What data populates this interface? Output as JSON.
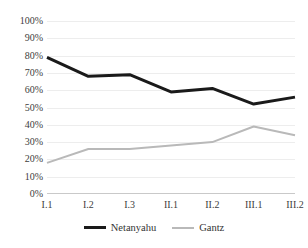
{
  "chart_data": {
    "type": "line",
    "title": "",
    "subtitle": "",
    "xlabel": "",
    "ylabel": "",
    "categories": [
      "I.1",
      "I.2",
      "I.3",
      "II.1",
      "II.2",
      "III.1",
      "III.2"
    ],
    "ylim": [
      0,
      100
    ],
    "ytick_step": 10,
    "ytick_labels": [
      "100%",
      "90%",
      "80%",
      "70%",
      "60%",
      "50%",
      "40%",
      "30%",
      "20%",
      "10%",
      "0%"
    ],
    "ytick_values": [
      100,
      90,
      80,
      70,
      60,
      50,
      40,
      30,
      20,
      10,
      0
    ],
    "grid": true,
    "grid_axis": "y",
    "legend_position": "bottom",
    "value_suffix": "%",
    "series": [
      {
        "name": "Netanyahu",
        "color": "#1a1a1a",
        "line_width": 3,
        "values": [
          79,
          68,
          69,
          59,
          61,
          52,
          56
        ]
      },
      {
        "name": "Gantz",
        "color": "#b9b9b9",
        "line_width": 2,
        "values": [
          18,
          26,
          26,
          28,
          30,
          39,
          34
        ]
      }
    ]
  },
  "legend": {
    "entries": [
      {
        "label": "Netanyahu",
        "swatch": "netanyahu"
      },
      {
        "label": "Gantz",
        "swatch": "gantz"
      }
    ]
  }
}
